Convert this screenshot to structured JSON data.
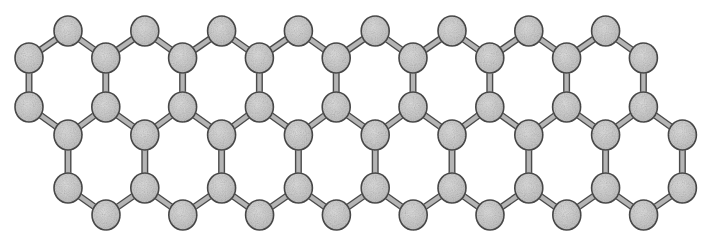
{
  "figure": {
    "background_color": "#ffffff",
    "width": 710,
    "height": 244
  },
  "style": {
    "atom_fill": "#cacaca",
    "atom_speckle_light": "#dcdcdc",
    "atom_speckle_dark": "#b0b0b0",
    "atom_stroke": "#4c4c4c",
    "atom_stroke_width": 1.6,
    "atom_radius_x": 14,
    "atom_radius_y": 15,
    "bond_outline_color": "#4a4a4a",
    "bond_core_color": "#b8b8b8",
    "bond_outline_width": 7,
    "bond_core_width": 4.2
  },
  "lattice": {
    "type": "honeycomb",
    "rows": 6,
    "column_spacing": 76.8,
    "rows_data": [
      {
        "name": "row-top-apex",
        "y": 31,
        "x_start": 68,
        "count": 8
      },
      {
        "name": "row-upper-inner",
        "y": 58,
        "x_start": 29,
        "count": 9
      },
      {
        "name": "row-mid-upper",
        "y": 107,
        "x_start": 29,
        "count": 9
      },
      {
        "name": "row-mid-lower",
        "y": 135,
        "x_start": 68,
        "count": 9
      },
      {
        "name": "row-lower-inner",
        "y": 188,
        "x_start": 68,
        "count": 9
      },
      {
        "name": "row-bottom-apex",
        "y": 215,
        "x_start": 106,
        "count": 8
      }
    ],
    "bond_pairs": [
      [
        0,
        1,
        "zigzag-down-left"
      ],
      [
        1,
        0,
        "zigzag-down-right"
      ],
      [
        1,
        2,
        "vertical"
      ],
      [
        2,
        3,
        "zigzag-down-right"
      ],
      [
        3,
        2,
        "zigzag-down-left"
      ],
      [
        3,
        4,
        "vertical"
      ],
      [
        4,
        5,
        "zigzag-down-right"
      ],
      [
        5,
        4,
        "zigzag-down-left"
      ]
    ],
    "atom_count_total": 52,
    "element": "C"
  }
}
